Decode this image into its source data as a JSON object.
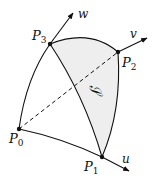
{
  "diagram": {
    "points": [
      {
        "name": "P",
        "sub": "0",
        "x": 19,
        "y": 129,
        "label_x": 9,
        "label_y": 143
      },
      {
        "name": "P",
        "sub": "1",
        "x": 102,
        "y": 157,
        "label_x": 84,
        "label_y": 171
      },
      {
        "name": "P",
        "sub": "2",
        "x": 118,
        "y": 52,
        "label_x": 122,
        "label_y": 67
      },
      {
        "name": "P",
        "sub": "3",
        "x": 50,
        "y": 44,
        "label_x": 32,
        "label_y": 40
      }
    ],
    "axes": [
      {
        "label": "u",
        "label_x": 122,
        "label_y": 163
      },
      {
        "label": "v",
        "label_x": 130,
        "label_y": 38
      },
      {
        "label": "w",
        "label_x": 78,
        "label_y": 18
      }
    ],
    "surface_label": "𝒮",
    "colors": {
      "stroke": "#111111",
      "fill": "#eeeeee",
      "background": "#ffffff"
    }
  }
}
